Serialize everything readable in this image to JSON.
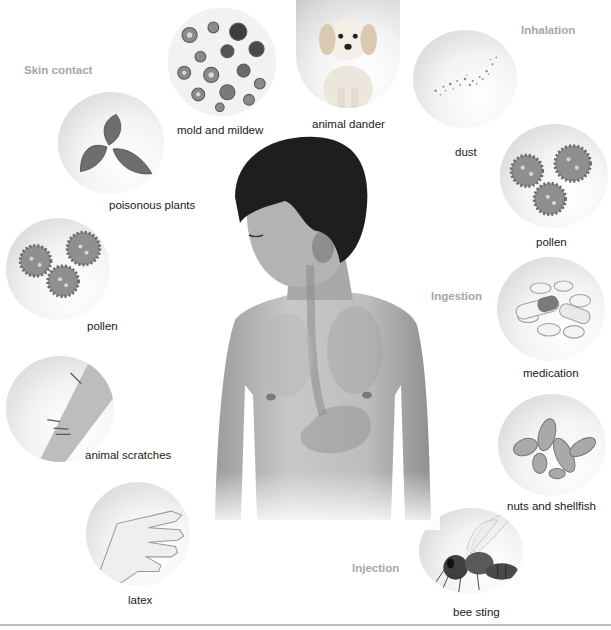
{
  "diagram": {
    "routes": {
      "skin_contact": "Skin contact",
      "inhalation": "Inhalation",
      "ingestion": "Ingestion",
      "injection": "Injection"
    },
    "allergens": {
      "mold": "mold and mildew",
      "dander": "animal dander",
      "dust": "dust",
      "pollen_inhaled": "pollen",
      "poison_plants": "poisonous plants",
      "pollen_skin": "pollen",
      "scratches": "animal scratches",
      "latex": "latex",
      "medication": "medication",
      "nuts": "nuts and shellfish",
      "bee": "bee sting"
    },
    "groups": [
      {
        "route": "Inhalation",
        "items": [
          "mold and mildew",
          "animal dander",
          "dust",
          "pollen"
        ]
      },
      {
        "route": "Skin contact",
        "items": [
          "poisonous plants",
          "pollen",
          "animal scratches",
          "latex"
        ]
      },
      {
        "route": "Ingestion",
        "items": [
          "medication",
          "nuts and shellfish"
        ]
      },
      {
        "route": "Injection",
        "items": [
          "bee sting"
        ]
      }
    ],
    "colors": {
      "route_label": "#a6a6a6",
      "item_label": "#1a1a1a",
      "background": "#ffffff",
      "rule": "#bdbdbd"
    }
  }
}
